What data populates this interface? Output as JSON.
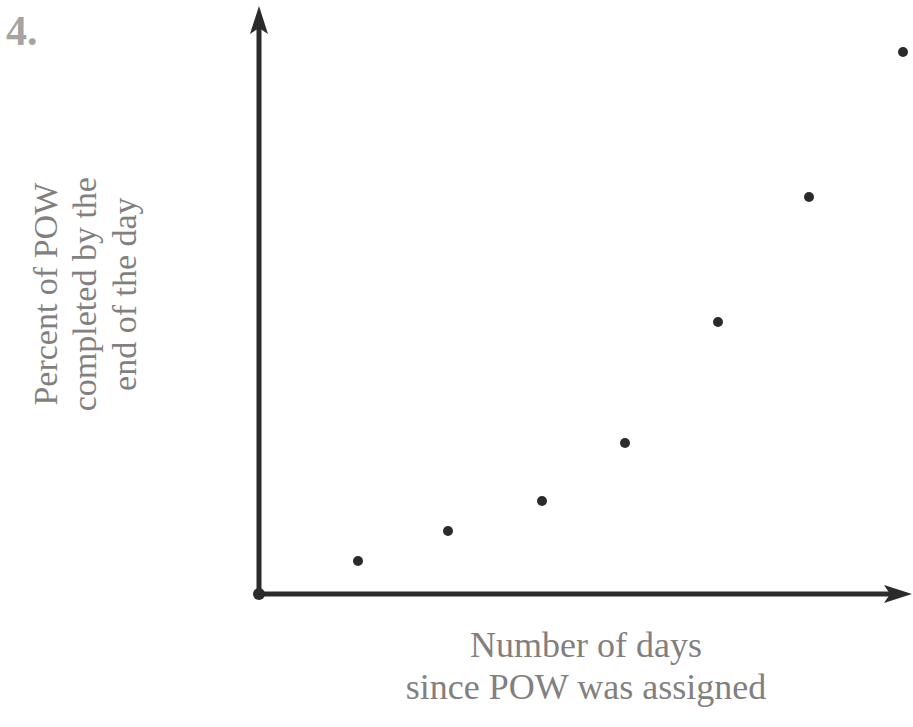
{
  "problem": {
    "number_label": "4."
  },
  "chart_data": {
    "type": "scatter",
    "title": "",
    "subtitle": "",
    "xlabel": "Number of days since POW was assigned",
    "ylabel": "Percent of POW completed by the end of the day",
    "xlabel_lines": [
      "Number of days",
      "since POW was assigned"
    ],
    "ylabel_lines": [
      "Percent of POW",
      "completed by the",
      "end of the day"
    ],
    "x": [
      1,
      2,
      3,
      4,
      5,
      6,
      7
    ],
    "y": [
      6,
      12,
      18,
      30,
      56,
      82,
      112
    ],
    "xtick_labels": [],
    "ytick_labels": [],
    "xlim": [
      0,
      7.6
    ],
    "ylim": [
      0,
      128
    ],
    "grid": false,
    "legend": null,
    "axes_style": "arrows-both",
    "origin_marker": true,
    "point_color": "#2b2b2b",
    "axis_color": "#2b2b2b",
    "label_color": "#837f7f",
    "background_color": "#ffffff",
    "point_radius_px": 5,
    "points_px": [
      {
        "cx": 358,
        "cy": 561
      },
      {
        "cx": 448,
        "cy": 531
      },
      {
        "cx": 542,
        "cy": 501
      },
      {
        "cx": 625,
        "cy": 443
      },
      {
        "cx": 718,
        "cy": 322
      },
      {
        "cx": 809,
        "cy": 197
      },
      {
        "cx": 903,
        "cy": 52
      }
    ]
  }
}
